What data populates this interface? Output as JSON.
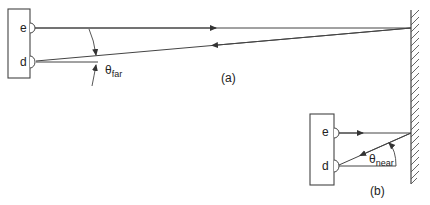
{
  "figure": {
    "panel_a": {
      "label": "(a)",
      "emitter_label": "e",
      "detector_label": "d",
      "angle_symbol": "θ",
      "angle_subscript": "far"
    },
    "panel_b": {
      "label": "(b)",
      "emitter_label": "e",
      "detector_label": "d",
      "angle_symbol": "θ",
      "angle_subscript": "near"
    },
    "colors": {
      "stroke": "#333333",
      "background": "#ffffff"
    }
  }
}
